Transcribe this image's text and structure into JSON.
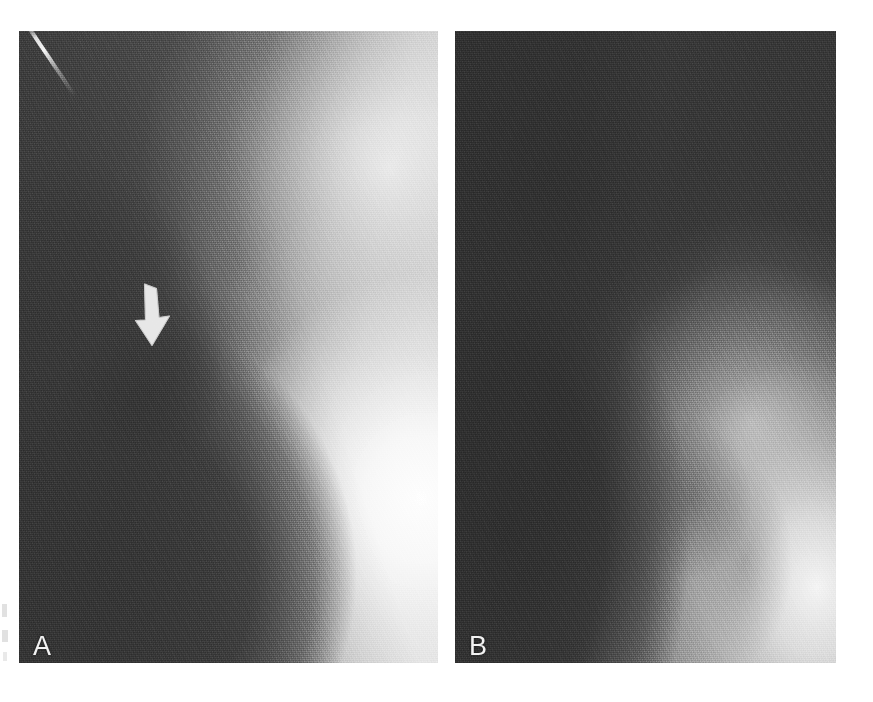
{
  "figure": {
    "kind": "radiograph-figure",
    "background_color": "#ffffff",
    "panel_count": 2
  },
  "panels": [
    {
      "id": "A",
      "label": "A",
      "label_color": "#f2f2f2",
      "modality": "radiograph",
      "position": {
        "left": 19,
        "top": 31,
        "width": 419,
        "height": 632
      },
      "appearance": {
        "darkest_gray": "#4c4c4c",
        "brightest_gray": "#f2f2f2",
        "soft_tissue_side": "left",
        "radiopaque_mass_side": "right"
      },
      "annotations": [
        {
          "type": "arrow",
          "name": "white-down-arrow",
          "direction": "down",
          "color": "#ededed",
          "left": 118,
          "top": 283,
          "width": 48,
          "height": 62
        }
      ],
      "artifacts": [
        {
          "type": "scratch",
          "name": "emulsion-scratch",
          "location": "top-left-corner",
          "color": "#ffffff"
        }
      ]
    },
    {
      "id": "B",
      "label": "B",
      "label_color": "#f2f2f2",
      "modality": "radiograph",
      "position": {
        "left": 455,
        "top": 31,
        "width": 381,
        "height": 632
      },
      "appearance": {
        "darkest_gray": "#303030",
        "brightest_gray": "#f4f4f4",
        "soft_tissue_side": "left",
        "radiopaque_mass_side": "lower-right"
      },
      "annotations": [],
      "artifacts": []
    }
  ],
  "margin_marks": [
    {
      "name": "margin-mark-1",
      "color": "#c9c9c9"
    },
    {
      "name": "margin-mark-2",
      "color": "#c9c9c9"
    },
    {
      "name": "margin-mark-3",
      "color": "#c9c9c9"
    }
  ]
}
